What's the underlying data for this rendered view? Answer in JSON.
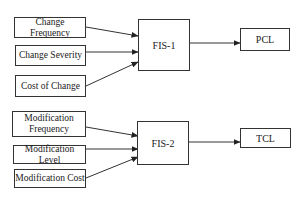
{
  "diagram": {
    "group1": {
      "inputs": [
        {
          "label": "Change Frequency"
        },
        {
          "label": "Change Severity"
        },
        {
          "label": "Cost of Change"
        }
      ],
      "processor": {
        "label": "FIS-1"
      },
      "output": {
        "label": "PCL"
      }
    },
    "group2": {
      "inputs": [
        {
          "label": "Modification Frequency"
        },
        {
          "label": "Modification Level"
        },
        {
          "label": "Modification Cost"
        }
      ],
      "processor": {
        "label": "FIS-2"
      },
      "output": {
        "label": "TCL"
      }
    },
    "colors": {
      "stroke": "#333333",
      "background": "#ffffff",
      "text": "#1a1a1a"
    }
  }
}
